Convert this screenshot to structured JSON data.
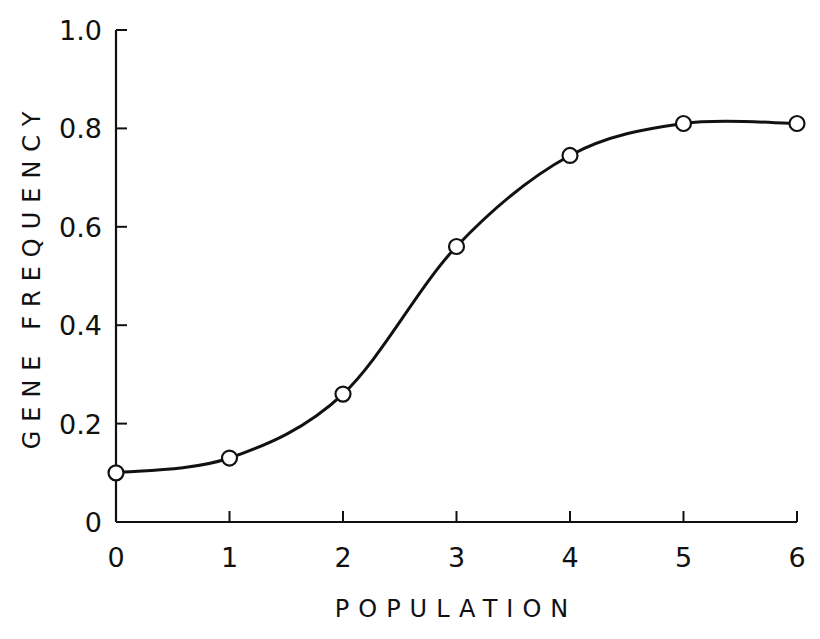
{
  "chart_data": {
    "type": "line",
    "title": "",
    "xlabel": "POPULATION",
    "ylabel": "GENE FREQUENCY",
    "x": [
      0,
      1,
      2,
      3,
      4,
      5,
      6
    ],
    "series": [
      {
        "name": "Gene frequency",
        "values": [
          0.1,
          0.13,
          0.26,
          0.56,
          0.745,
          0.81,
          0.81
        ],
        "marker": "open-circle",
        "smooth": true
      }
    ],
    "xlim": [
      0,
      6
    ],
    "ylim": [
      0,
      1.0
    ],
    "x_ticks": [
      "0",
      "1",
      "2",
      "3",
      "4",
      "5",
      "6"
    ],
    "y_ticks": [
      "0",
      "0.2",
      "0.4",
      "0.6",
      "0.8",
      "1.0"
    ],
    "y_tick_values": [
      0,
      0.2,
      0.4,
      0.6,
      0.8,
      1.0
    ],
    "grid": false,
    "legend": null
  },
  "colors": {
    "line": "#111111",
    "background": "#ffffff"
  }
}
